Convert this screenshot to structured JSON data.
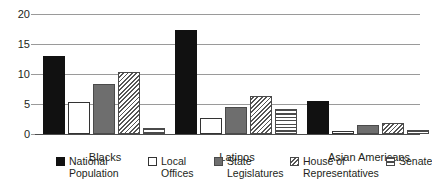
{
  "chart_data": {
    "type": "bar",
    "title": "",
    "subtitle": "",
    "xlabel": "",
    "ylabel": "",
    "ylim": [
      0,
      20
    ],
    "yticks": [
      0,
      5,
      10,
      15,
      20
    ],
    "ytick_labels": [
      "0",
      "5",
      "10",
      "15",
      "20"
    ],
    "grid": true,
    "legend_position": "bottom",
    "categories": [
      "Blacks",
      "Latinos",
      "Asian Americans"
    ],
    "series": [
      {
        "name": "National Population",
        "legend_label_line1": "National",
        "legend_label_line2": "Population",
        "pattern": "solid-black",
        "values": [
          13.0,
          17.3,
          5.5
        ]
      },
      {
        "name": "Local Offices",
        "legend_label_line1": "Local",
        "legend_label_line2": "Offices",
        "pattern": "open-white",
        "values": [
          5.3,
          2.6,
          0.5
        ]
      },
      {
        "name": "State Legislatures",
        "legend_label_line1": "State",
        "legend_label_line2": "Legislatures",
        "pattern": "solid-gray",
        "values": [
          8.4,
          4.5,
          1.5
        ]
      },
      {
        "name": "House of Representatives",
        "legend_label_line1": "House of",
        "legend_label_line2": "Representatives",
        "pattern": "diagonal-hatch",
        "values": [
          10.3,
          6.4,
          1.9
        ]
      },
      {
        "name": "Senate",
        "legend_label_line1": "Senate",
        "legend_label_line2": "",
        "pattern": "horizontal-lines",
        "values": [
          1.0,
          4.2,
          0.7
        ]
      }
    ]
  },
  "colors": {
    "national": "#111111",
    "local": "#ffffff",
    "state": "#6e6e6e",
    "hatch": "#555555",
    "gridline": "#9a9a9a",
    "axis": "#4d4d4d",
    "text": "#231f20",
    "background": "#ffffff"
  }
}
